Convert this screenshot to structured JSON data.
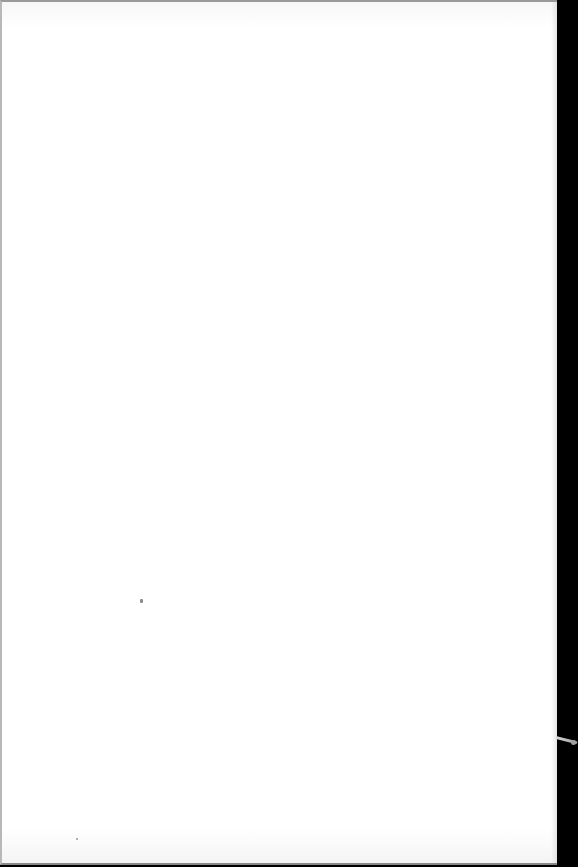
{
  "scene": {
    "description": "Blank white sheet of paper photographed against a dark background",
    "colors": {
      "paper": "#ffffff",
      "background": "#000000",
      "edge_shadow": "#9a9a9a"
    },
    "text_content": []
  }
}
